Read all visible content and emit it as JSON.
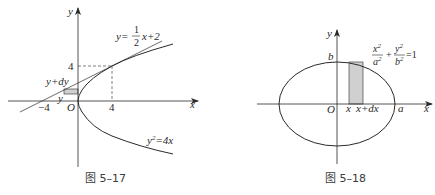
{
  "figures": [
    {
      "caption": "图 5–17",
      "axis_labels": {
        "x": "x",
        "y": "y",
        "origin": "O"
      },
      "ticks": {
        "x_neg": "−4",
        "x_pos": "4",
        "y_pos": "4"
      },
      "strip_labels": {
        "upper": "y+dy",
        "lower": "y"
      },
      "line_equation": {
        "lhs": "y=",
        "num": "1",
        "den": "2",
        "rhs": "x+2"
      },
      "curve_equation": {
        "lhs": "y",
        "exp": "2",
        "rhs": "=4x"
      },
      "colors": {
        "stroke": "#2a2a2a",
        "strip_fill": "#d0d0d0"
      }
    },
    {
      "caption": "图 5–18",
      "axis_labels": {
        "x": "x",
        "y": "y",
        "origin": "O"
      },
      "ticks": {
        "a": "a",
        "b": "b"
      },
      "strip_labels": {
        "left": "x",
        "right": "x+dx"
      },
      "ellipse_equation": {
        "t1_num": "x",
        "t1_num_exp": "2",
        "t1_den": "a",
        "t1_den_exp": "2",
        "plus": "+",
        "t2_num": "y",
        "t2_num_exp": "2",
        "t2_den": "b",
        "t2_den_exp": "2",
        "rhs": "=1"
      },
      "colors": {
        "stroke": "#2a2a2a",
        "strip_fill": "#d0d0d0"
      }
    }
  ]
}
